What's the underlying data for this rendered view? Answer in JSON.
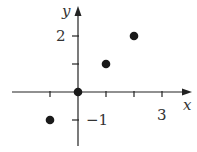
{
  "chart_data": {
    "type": "scatter",
    "title": "",
    "xlabel": "x",
    "ylabel": "y",
    "points": [
      {
        "x": -1,
        "y": -1
      },
      {
        "x": 0,
        "y": 0
      },
      {
        "x": 1,
        "y": 1
      },
      {
        "x": 2,
        "y": 2
      }
    ],
    "x_ticks": [
      -1,
      1,
      2,
      3
    ],
    "y_ticks": [
      -1,
      1,
      2
    ],
    "x_tick_labels": [
      {
        "value": 3,
        "label": "3"
      }
    ],
    "y_tick_labels": [
      {
        "value": 2,
        "label": "2"
      },
      {
        "value": -1,
        "label": "−1"
      }
    ],
    "xlim": [
      -2.8,
      4.0
    ],
    "ylim": [
      -2.0,
      3.0
    ],
    "grid": false,
    "legend": null,
    "colors": {
      "axis": "#222222",
      "point": "#1a1a1a",
      "text": "#333333"
    }
  }
}
